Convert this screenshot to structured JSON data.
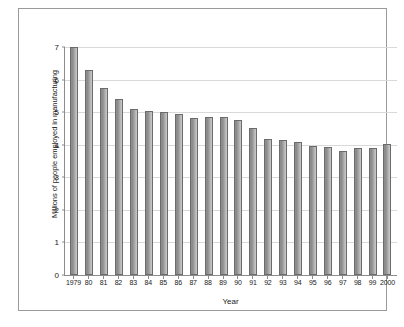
{
  "chart_data": {
    "type": "bar",
    "title": "",
    "xlabel": "Year",
    "ylabel": "Millions of people employed in manufacturing",
    "ylim": [
      0,
      7
    ],
    "yticks": [
      0,
      1,
      2,
      3,
      4,
      5,
      6,
      7
    ],
    "ytick_labels": [
      "0",
      "1",
      "2",
      "3",
      "4",
      "5",
      "6",
      "7"
    ],
    "grid": true,
    "legend": null,
    "bar_color": "#9c9c9c",
    "bar_edge_color": "#6b6b6b",
    "categories": [
      "1979",
      "80",
      "81",
      "82",
      "83",
      "84",
      "85",
      "86",
      "87",
      "88",
      "89",
      "90",
      "91",
      "92",
      "93",
      "94",
      "95",
      "96",
      "97",
      "98",
      "99",
      "2000"
    ],
    "values": [
      7.0,
      6.28,
      5.75,
      5.4,
      5.09,
      5.05,
      5.02,
      4.95,
      4.82,
      4.86,
      4.85,
      4.76,
      4.5,
      4.18,
      4.16,
      4.09,
      3.97,
      3.92,
      3.82,
      3.91,
      3.9,
      4.02
    ],
    "series": [
      {
        "name": "Millions of people employed in manufacturing",
        "values": [
          7.0,
          6.28,
          5.75,
          5.4,
          5.09,
          5.05,
          5.02,
          4.95,
          4.82,
          4.86,
          4.85,
          4.76,
          4.5,
          4.18,
          4.16,
          4.09,
          3.97,
          3.92,
          3.82,
          3.91,
          3.9,
          4.02
        ]
      }
    ]
  }
}
